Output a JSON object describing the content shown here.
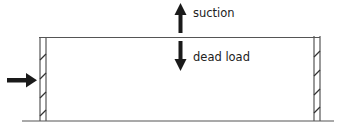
{
  "diagram": {
    "type": "structural-load-diagram",
    "colors": {
      "line": "#555555",
      "arrow": "#1a1a1a",
      "text": "#222222",
      "background": "#ffffff"
    },
    "elements": {
      "roof": {
        "label": "roof"
      },
      "left_wall": {
        "label": "left wall",
        "hatched": true
      },
      "right_wall": {
        "label": "right wall",
        "hatched": true
      },
      "ground": {
        "label": "ground line"
      }
    },
    "loads": [
      {
        "id": "wind",
        "direction": "right",
        "label": ""
      },
      {
        "id": "suction",
        "direction": "up",
        "label": "suction"
      },
      {
        "id": "dead_load",
        "direction": "down",
        "label": "dead load"
      }
    ]
  }
}
